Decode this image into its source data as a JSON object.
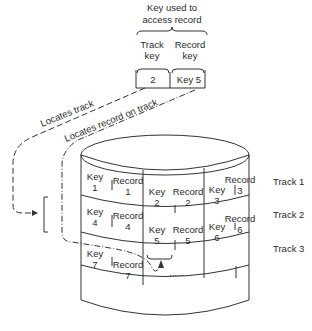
{
  "diagram": {
    "title_line1": "Key used to",
    "title_line2": "access record",
    "track_key_label1": "Track",
    "track_key_label2": "key",
    "record_key_label1": "Record",
    "record_key_label2": "key",
    "track_key_value": "2",
    "record_key_value": "Key 5",
    "arrow_track_label": "Locates track",
    "arrow_record_label": "Locates record on track",
    "tracks": [
      {
        "label": "Track 1",
        "cells": [
          {
            "key": "Key",
            "key_n": "1",
            "rec": "Record",
            "rec_n": "1"
          },
          {
            "key": "Key",
            "key_n": "2",
            "rec": "Record",
            "rec_n": "2"
          },
          {
            "key": "Key",
            "key_n": "3",
            "rec": "Record",
            "rec_n": "3"
          }
        ]
      },
      {
        "label": "Track 2",
        "cells": [
          {
            "key": "Key",
            "key_n": "4",
            "rec": "Record",
            "rec_n": "4"
          },
          {
            "key": "Key",
            "key_n": "5",
            "rec": "Record",
            "rec_n": "5"
          },
          {
            "key": "Key",
            "key_n": "6",
            "rec": "Record",
            "rec_n": "6"
          }
        ]
      },
      {
        "label": "Track 3",
        "cells": [
          {
            "key": "Key",
            "key_n": "7",
            "rec": "Record",
            "rec_n": "7"
          },
          {
            "dots": "......"
          }
        ]
      }
    ]
  }
}
